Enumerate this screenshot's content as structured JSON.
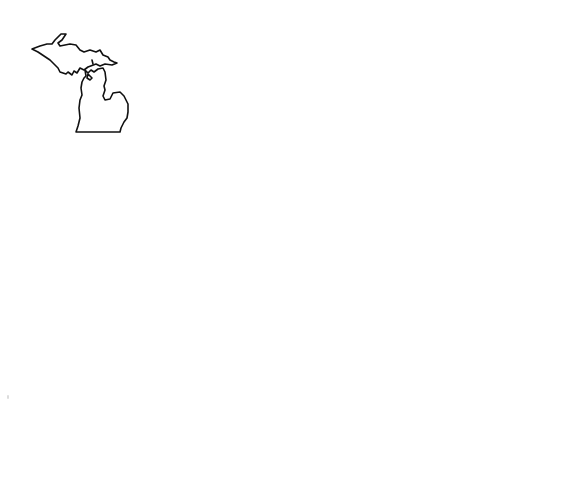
{
  "layout": {
    "rows": 3,
    "columns": 3
  },
  "colors": {
    "background": "#ffffff",
    "outline": "#111111"
  },
  "states": [
    {
      "name": "Michigan",
      "row": 1,
      "col": 1
    },
    {
      "name": "Wisconsin",
      "row": 1,
      "col": 2
    },
    {
      "name": "Georgia",
      "row": 1,
      "col": 3
    },
    {
      "name": "Nebraska",
      "row": 2,
      "col": 1
    },
    {
      "name": "Kentucky",
      "row": 2,
      "col": 2
    },
    {
      "name": "Missouri",
      "row": 2,
      "col": 3
    },
    {
      "name": "Delaware",
      "row": 3,
      "col": 1
    },
    {
      "name": "Alabama",
      "row": 3,
      "col": 2
    },
    {
      "name": "Vermont",
      "row": 3,
      "col": 3
    }
  ]
}
